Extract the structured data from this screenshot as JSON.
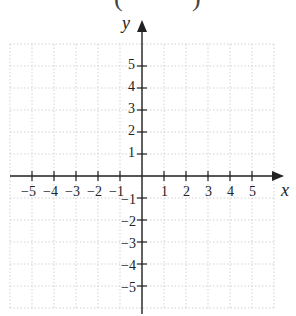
{
  "diagram": {
    "type": "coordinate-plane",
    "top_fragment": {
      "left_paren": "(",
      "right_paren": ")"
    },
    "axes": {
      "x_label": "x",
      "y_label": "y",
      "x_ticks": [
        "-5",
        "-4",
        "-3",
        "-2",
        "-1",
        "1",
        "2",
        "3",
        "4",
        "5"
      ],
      "y_ticks_positive": [
        "5",
        "4",
        "3",
        "2",
        "1"
      ],
      "y_ticks_negative": [
        "-1",
        "-2",
        "-3",
        "-4",
        "-5"
      ]
    },
    "grid": {
      "range_x": [
        -6,
        6
      ],
      "range_y": [
        -6,
        6
      ],
      "style": "dotted",
      "color": "#c8c8c8"
    },
    "colors": {
      "axis": "#222222",
      "background": "#ffffff"
    }
  }
}
